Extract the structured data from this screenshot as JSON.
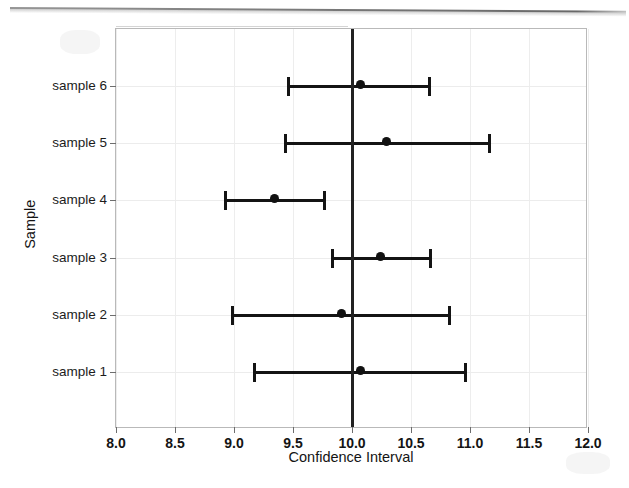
{
  "chart_data": {
    "type": "scatter",
    "title": "",
    "xlabel": "Confidence Interval",
    "ylabel": "Sample",
    "xlim": [
      8.0,
      12.0
    ],
    "xticks": [
      "8.0",
      "8.5",
      "9.0",
      "9.5",
      "10.0",
      "10.5",
      "11.0",
      "11.5",
      "12.0"
    ],
    "xtick_values": [
      8.0,
      8.5,
      9.0,
      9.5,
      10.0,
      10.5,
      11.0,
      11.5,
      12.0
    ],
    "categories": [
      "sample 1",
      "sample 2",
      "sample 3",
      "sample 4",
      "sample 5",
      "sample 6"
    ],
    "grid": true,
    "legend": "none",
    "reference_line": {
      "value": 10.0,
      "orientation": "vertical",
      "color": "#222222",
      "label": "10.0"
    },
    "series": [
      {
        "name": "Confidence intervals",
        "orientation": "horizontal",
        "points": [
          {
            "category": "sample 1",
            "mean": 10.07,
            "lower": 9.17,
            "upper": 10.97
          },
          {
            "category": "sample 2",
            "mean": 9.91,
            "lower": 8.98,
            "upper": 10.83
          },
          {
            "category": "sample 3",
            "mean": 10.24,
            "lower": 9.83,
            "upper": 10.67
          },
          {
            "category": "sample 4",
            "mean": 9.34,
            "lower": 8.92,
            "upper": 9.77
          },
          {
            "category": "sample 5",
            "mean": 10.29,
            "lower": 9.43,
            "upper": 11.17
          },
          {
            "category": "sample 6",
            "mean": 10.07,
            "lower": 9.46,
            "upper": 10.66
          }
        ]
      }
    ],
    "colors": {
      "marker": "#111111",
      "error_bar": "#141414",
      "reference_line": "#222222",
      "grid": "#ededed",
      "frame": "#b9b9b9",
      "background": "#ffffff"
    }
  }
}
